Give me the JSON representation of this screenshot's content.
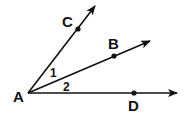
{
  "diagram": {
    "vertex": {
      "label": "A",
      "x": 28,
      "y": 93
    },
    "rays": [
      {
        "name": "AC",
        "tip": {
          "x": 96,
          "y": 5
        },
        "point": {
          "label": "C",
          "x": 78,
          "y": 29
        }
      },
      {
        "name": "AB",
        "tip": {
          "x": 151,
          "y": 40
        },
        "point": {
          "label": "B",
          "x": 114,
          "y": 56
        }
      },
      {
        "name": "AD",
        "tip": {
          "x": 178,
          "y": 93
        },
        "point": {
          "label": "D",
          "x": 134,
          "y": 93
        }
      }
    ],
    "angles": [
      {
        "label": "1",
        "between": "AC-AB"
      },
      {
        "label": "2",
        "between": "AB-AD"
      }
    ],
    "colors": {
      "stroke": "#111111",
      "background": "#ffffff"
    }
  }
}
